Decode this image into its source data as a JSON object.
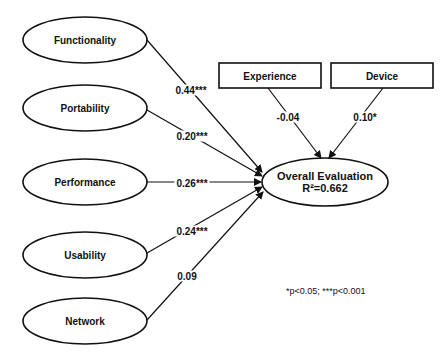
{
  "diagram": {
    "type": "path-model",
    "predictors": [
      {
        "label": "Functionality",
        "coefficient": "0.44***"
      },
      {
        "label": "Portability",
        "coefficient": "0.20***"
      },
      {
        "label": "Performance",
        "coefficient": "0.26***"
      },
      {
        "label": "Usability",
        "coefficient": "0.24***"
      },
      {
        "label": "Network",
        "coefficient": "0.09"
      }
    ],
    "controls": [
      {
        "label": "Experience",
        "coefficient": "-0.04"
      },
      {
        "label": "Device",
        "coefficient": "0.10*"
      }
    ],
    "outcome": {
      "label": "Overall Evaluation",
      "r_squared": "R²=0.662"
    },
    "significance_note": "*p<0.05; ***p<0.001"
  }
}
